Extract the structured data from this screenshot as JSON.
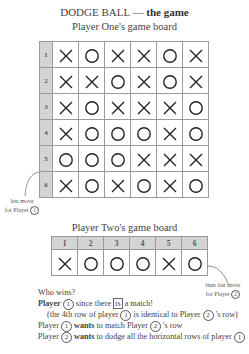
{
  "title": {
    "main": "DODGE BALL — ",
    "bold": "the game"
  },
  "player_one_board": {
    "label": "Player One's game board",
    "row_labels": [
      "1",
      "2",
      "3",
      "4",
      "5",
      "6"
    ],
    "rows": [
      [
        "X",
        "O",
        "X",
        "X",
        "O",
        "X"
      ],
      [
        "X",
        "X",
        "O",
        "X",
        "O",
        "X"
      ],
      [
        "X",
        "O",
        "X",
        "X",
        "X",
        "O"
      ],
      [
        "X",
        "O",
        "O",
        "O",
        "X",
        "O"
      ],
      [
        "O",
        "O",
        "O",
        "X",
        "X",
        "X"
      ],
      [
        "X",
        "O",
        "X",
        "O",
        "X",
        "O"
      ]
    ],
    "annotation": {
      "line1": "last move",
      "line2": "for Player",
      "player": "1"
    }
  },
  "player_two_board": {
    "label": "Player Two's game board",
    "column_labels": [
      "1",
      "2",
      "3",
      "4",
      "5",
      "6"
    ],
    "row": [
      "X",
      "O",
      "O",
      "O",
      "X",
      "O"
    ],
    "annotation": {
      "line1": "then last move",
      "line2": "for Player",
      "player": "2"
    }
  },
  "explanation": {
    "question": "Who wins?",
    "answer_bold": "Player",
    "answer_player": "1",
    "answer_rest_1": " since there ",
    "answer_boxed": "is",
    "answer_rest_2": " a match!",
    "detail_1": "(the 4th row of player ",
    "detail_p1": "1",
    "detail_2": " is identical to Player ",
    "detail_p2": "2",
    "detail_3": " 's row)",
    "line3_a": "Player ",
    "line3_p": "1",
    "line3_bold": " wants",
    "line3_b": " to match Player ",
    "line3_p2": "2",
    "line3_c": " 's row",
    "line4_a": "Player ",
    "line4_p": "2",
    "line4_bold": " wants",
    "line4_b": " to dodge all the horizontal rows of player ",
    "line4_p2": "1"
  }
}
